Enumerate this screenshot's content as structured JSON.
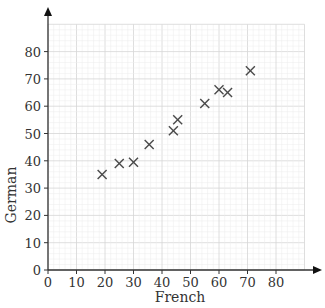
{
  "chart_data": {
    "type": "scatter",
    "title": "",
    "xlabel": "French",
    "ylabel": "German",
    "xlim": [
      0,
      90
    ],
    "ylim": [
      0,
      90
    ],
    "x_ticks": [
      0,
      10,
      20,
      30,
      40,
      50,
      60,
      70,
      80
    ],
    "y_ticks": [
      0,
      10,
      20,
      30,
      40,
      50,
      60,
      70,
      80
    ],
    "grid": true,
    "marker": "x",
    "points": [
      {
        "x": 19,
        "y": 35
      },
      {
        "x": 25,
        "y": 39
      },
      {
        "x": 30,
        "y": 39.5
      },
      {
        "x": 35.5,
        "y": 46
      },
      {
        "x": 44,
        "y": 51
      },
      {
        "x": 45.5,
        "y": 55
      },
      {
        "x": 55,
        "y": 61
      },
      {
        "x": 60,
        "y": 66
      },
      {
        "x": 63,
        "y": 65
      },
      {
        "x": 71,
        "y": 73
      }
    ]
  },
  "colors": {
    "grid_minor": "#ececec",
    "grid_major": "#d6d6d6",
    "axis": "#333333",
    "marker": "#4a4a4a"
  }
}
